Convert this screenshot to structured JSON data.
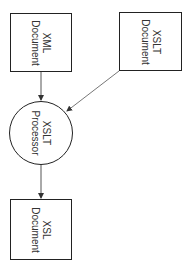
{
  "diagram": {
    "nodes": [
      {
        "id": "xml",
        "shape": "rect",
        "lines": [
          "XML",
          "Document"
        ]
      },
      {
        "id": "xslt",
        "shape": "rect",
        "lines": [
          "XSLT",
          "Document"
        ]
      },
      {
        "id": "processor",
        "shape": "circle",
        "lines": [
          "XSLT",
          "Processor"
        ]
      },
      {
        "id": "xsl",
        "shape": "rect",
        "lines": [
          "XSL",
          "Document"
        ]
      }
    ],
    "edges": [
      {
        "from": "xml",
        "to": "processor"
      },
      {
        "from": "xslt",
        "to": "processor"
      },
      {
        "from": "processor",
        "to": "xsl"
      }
    ],
    "colors": {
      "stroke": "#222222",
      "edge": "#555555",
      "text": "#333333"
    }
  }
}
